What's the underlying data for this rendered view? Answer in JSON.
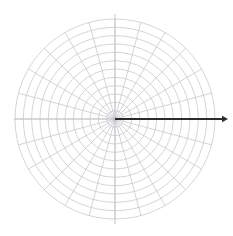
{
  "figure": {
    "name": "polar-grid-with-vector",
    "title": "",
    "background_color": "#ffffff",
    "width": 233,
    "height": 236
  },
  "chart_data": {
    "type": "scatter",
    "subtype": "polar-grid",
    "title": "",
    "subtitle": "",
    "xlabel": "",
    "ylabel": "",
    "grid": true,
    "legend": null,
    "legend_position": "none",
    "projection": "polar",
    "center": {
      "x": 115,
      "y": 119
    },
    "radial_axis": {
      "label": "",
      "min": 0,
      "max": 12,
      "tick_count": 12,
      "tick_labels": [],
      "outer_radius_px": 100,
      "ring_spacing_px": 8.333,
      "ring_radii_px": [
        8.33,
        16.67,
        25,
        33.33,
        41.67,
        50,
        58.33,
        66.67,
        75,
        83.33,
        91.67,
        100
      ]
    },
    "angular_axis": {
      "label": "",
      "unit": "degrees",
      "spoke_count": 24,
      "spoke_step_deg": 15,
      "tick_labels": [],
      "spoke_angles_deg": [
        0,
        15,
        30,
        45,
        60,
        75,
        90,
        105,
        120,
        135,
        150,
        165,
        180,
        195,
        210,
        225,
        240,
        255,
        270,
        285,
        300,
        315,
        330,
        345
      ]
    },
    "axes_lines": {
      "horizontal": {
        "from_x": 14,
        "to_x": 219,
        "y": 119
      },
      "vertical": {
        "x": 115,
        "from_y": 14,
        "to_y": 224
      }
    },
    "series": [
      {
        "name": "vector",
        "type": "arrow",
        "angle_deg": 0,
        "r_start": 0,
        "r_end": 13.5,
        "start_point": {
          "x": 115,
          "y": 119
        },
        "end_point": {
          "x": 228,
          "y": 119
        },
        "color": "#2b2b2b",
        "line_width": 2,
        "arrowhead": true,
        "label": ""
      }
    ],
    "annotations": []
  },
  "style": {
    "grid_color": "#c3c3c9",
    "grid_line_width": 0.7,
    "axis_color": "#b9b9bf",
    "axis_line_width": 0.8,
    "vector_color": "#2b2b2b",
    "background_color": "#ffffff"
  },
  "accessibility": {
    "figure_description": "Polar coordinate grid with 12 concentric circles and 24 radial spokes, with a dark arrow pointing right along the zero degree axis."
  }
}
